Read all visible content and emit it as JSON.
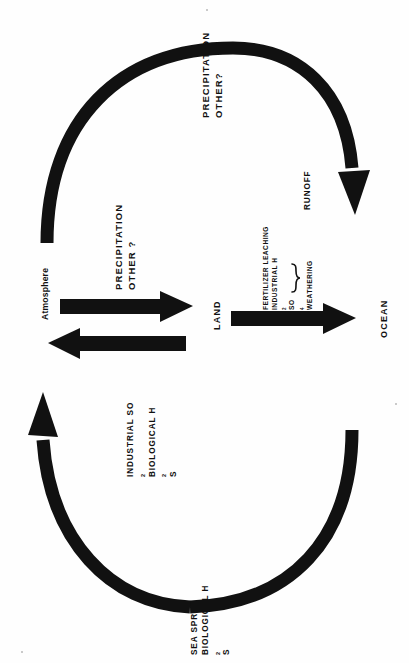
{
  "diagram": {
    "orientation": "rotated-90",
    "ink_color": "#111111",
    "background_color": "#fefefe",
    "nodes": {
      "atmosphere": "Atmosphere",
      "land": "LAND",
      "ocean": "OCEAN"
    },
    "flux_labels": {
      "precipitation_other_q": {
        "line1": "PRECIPITATION",
        "line2": "OTHER?"
      },
      "precipitation_other_q_land": {
        "line1": "PRECIPITATION",
        "line2": "OTHER ?"
      },
      "emissions_to_atmosphere": {
        "line1": "INDUSTRIAL SO",
        "sub1": "2",
        "line2": "BIOLOGICAL H",
        "sub2": "2",
        "line2b": "S"
      },
      "sea_spray": {
        "line1": "SEA SPRAY",
        "line2": "BIOLOGICAL H",
        "sub2": "2",
        "line2b": "S"
      },
      "runoff_group": {
        "bracket_label": "RUNOFF",
        "items": [
          "FERTILIZER LEACHING",
          "INDUSTRIAL H2SO4",
          "WEATHERING"
        ],
        "item1": "FERTILIZER LEACHING",
        "item2_pre": "INDUSTRIAL H",
        "item2_sub1": "2",
        "item2_mid": "SO",
        "item2_sub2": "4",
        "item3": "WEATHERING"
      }
    },
    "arrows": {
      "arc_atmosphere_to_ocean": "curved arrow from atmosphere arcing to ocean, arrowhead at ocean",
      "arc_ocean_to_atmosphere": "curved arrow from ocean arcing to atmosphere, arrowhead at atmosphere",
      "straight_atmosphere_to_land": "straight arrow, arrowhead at land",
      "straight_land_to_atmosphere": "straight arrow, arrowhead at atmosphere",
      "straight_land_to_ocean": "straight arrow, arrowhead at ocean"
    }
  }
}
